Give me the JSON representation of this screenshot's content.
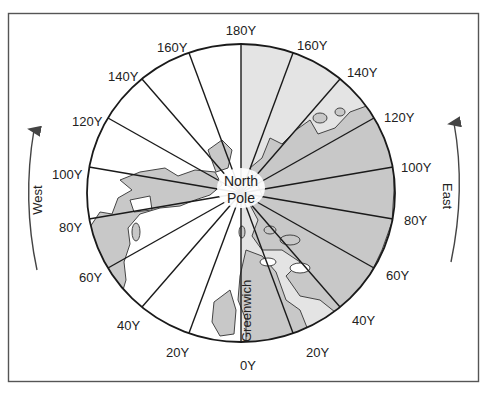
{
  "diagram": {
    "center_label_line1": "North",
    "center_label_line2": "Pole",
    "prime_meridian_label": "Greenwich",
    "west_label": "West",
    "east_label": "East",
    "colors": {
      "frame": "#555555",
      "line": "#1a1a1a",
      "land": "#c9c9c9",
      "east_hemisphere": "#e4e4e4",
      "west_hemisphere": "#ffffff",
      "text": "#222222"
    },
    "longitude_labels": {
      "top": "180Υ",
      "w160": "160Υ",
      "w140": "140Υ",
      "w120": "120Υ",
      "w100": "100Υ",
      "w80": "80Υ",
      "w60": "60Υ",
      "w40": "40Υ",
      "w20": "20Υ",
      "zero": "0Υ",
      "e20": "20Υ",
      "e40": "40Υ",
      "e60": "60Υ",
      "e80": "80Υ",
      "e100": "100Υ",
      "e120": "120Υ",
      "e140": "140Υ",
      "e160": "160Υ"
    }
  }
}
